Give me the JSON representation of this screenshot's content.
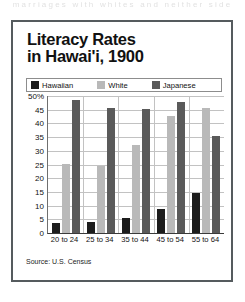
{
  "scan": {
    "top_clipped_text": "marriages with whites and neither side"
  },
  "chart_data": {
    "type": "bar",
    "title": "Literacy Rates in Hawai'i, 1900",
    "title_lines": [
      "Literacy Rates",
      "in Hawai'i, 1900"
    ],
    "xlabel": "",
    "ylabel": "",
    "ylim": [
      0,
      50
    ],
    "grid": true,
    "legend_position": "top",
    "categories": [
      "20 to 24",
      "25 to 34",
      "35 to 44",
      "45 to 54",
      "55 to 64"
    ],
    "ytick_labels": [
      "50%",
      "45",
      "40",
      "35",
      "30",
      "25",
      "20",
      "15",
      "10",
      "5",
      "0"
    ],
    "ytick_values": [
      50,
      45,
      40,
      35,
      30,
      25,
      20,
      15,
      10,
      5,
      0
    ],
    "series": [
      {
        "name": "Hawaiian",
        "color": "#1c1c1c",
        "values": [
          3.5,
          4.1,
          5.6,
          8.7,
          14.5
        ]
      },
      {
        "name": "White",
        "color": "#b9b9b9",
        "values": [
          25.2,
          24.6,
          32.3,
          42.8,
          45.5
        ]
      },
      {
        "name": "Japanese",
        "color": "#5a5a5a",
        "values": [
          48.4,
          45.8,
          45.2,
          47.9,
          35.5
        ]
      }
    ],
    "source": "Source: U.S. Census"
  },
  "colors": {
    "frame": "#555b5e",
    "gridline": "#c2c2c2",
    "axis": "#3a3a3a",
    "text": "#111111",
    "background": "#ffffff"
  }
}
